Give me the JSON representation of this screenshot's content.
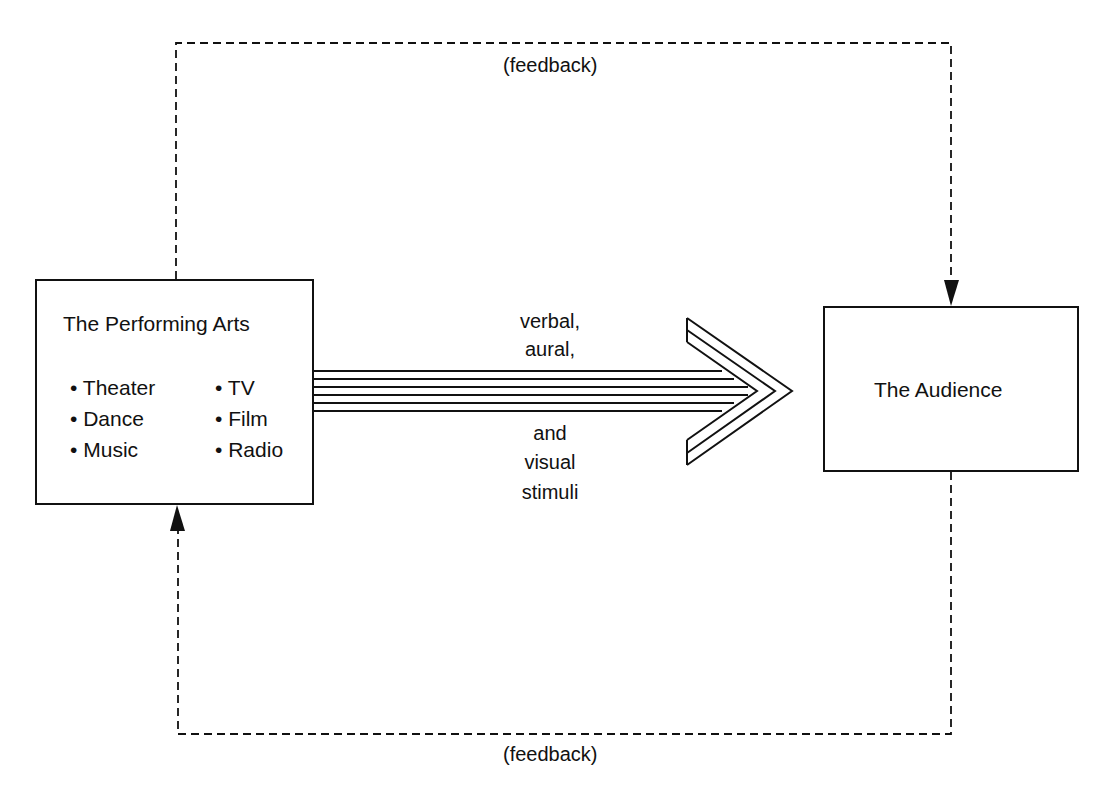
{
  "diagram": {
    "source_box": {
      "title": "The Performing Arts",
      "items_left": [
        "Theater",
        "Dance",
        "Music"
      ],
      "items_right": [
        "TV",
        "Film",
        "Radio"
      ],
      "bullet": "•"
    },
    "target_box": {
      "title": "The Audience"
    },
    "stimuli_label": {
      "above": [
        "verbal,",
        "aural,"
      ],
      "below": [
        "and",
        "visual",
        "stimuli"
      ]
    },
    "feedback_top": "(feedback)",
    "feedback_bottom": "(feedback)",
    "colors": {
      "stroke": "#111111",
      "background": "#ffffff"
    }
  }
}
